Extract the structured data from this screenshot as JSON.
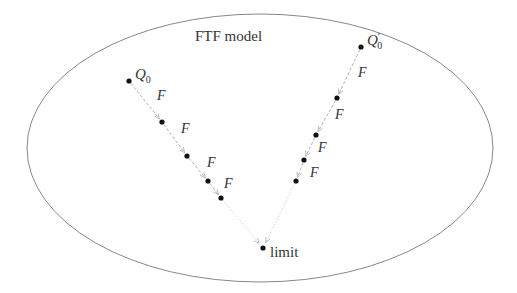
{
  "diagram": {
    "title": "FTF model",
    "region": {
      "cx": 260,
      "cy": 148,
      "rx": 233,
      "ry": 134,
      "stroke": "#7a7a7a"
    },
    "dot_color": "#111111",
    "arrow_color": "#b0b0b0",
    "limit": {
      "label": "limit",
      "x": 263,
      "y": 248
    },
    "chains": [
      {
        "start_label": "Q",
        "start_sub": "0",
        "start_prime": "",
        "points": [
          [
            129,
            81
          ],
          [
            162,
            122
          ],
          [
            187,
            156
          ],
          [
            208,
            181
          ],
          [
            221,
            198
          ]
        ],
        "edge_label": "F",
        "edge_labels": [
          [
            157,
            100
          ],
          [
            181,
            133
          ],
          [
            207,
            167
          ],
          [
            224,
            188
          ]
        ]
      },
      {
        "start_label": "Q",
        "start_sub": "0",
        "start_prime": "′",
        "points": [
          [
            361,
            47
          ],
          [
            337,
            98
          ],
          [
            316,
            135
          ],
          [
            304,
            160
          ],
          [
            296,
            181
          ]
        ],
        "edge_label": "F",
        "edge_labels": [
          [
            358,
            77
          ],
          [
            335,
            119
          ],
          [
            318,
            152
          ],
          [
            310,
            177
          ]
        ]
      }
    ]
  }
}
